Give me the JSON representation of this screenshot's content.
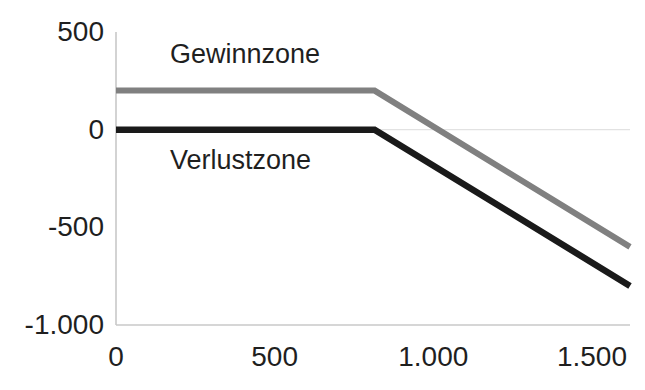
{
  "chart_data": {
    "type": "line",
    "title": "",
    "subtitle": "",
    "xlabel": "",
    "ylabel": "",
    "xlim": [
      0,
      1620
    ],
    "ylim": [
      -1000,
      500
    ],
    "xticks": [
      0,
      500,
      1000,
      1500
    ],
    "xticklabels": [
      "0",
      "500",
      "1.000",
      "1.500"
    ],
    "yticks": [
      500,
      0,
      -500,
      -1000
    ],
    "yticklabels": [
      "500",
      "0",
      "-500",
      "-1.000"
    ],
    "grid": false,
    "zero_line": true,
    "legend_position": "none",
    "annotations": [
      {
        "text": "Gewinnzone",
        "x": 170,
        "y": 380
      },
      {
        "text": "Verlustzone",
        "x": 170,
        "y": -160
      }
    ],
    "series": [
      {
        "name": "upper-line",
        "color": "#808080",
        "x": [
          0,
          815,
          1620
        ],
        "values": [
          200,
          200,
          -600
        ]
      },
      {
        "name": "lower-line",
        "color": "#1a1a1a",
        "x": [
          0,
          815,
          1620
        ],
        "values": [
          0,
          0,
          -800
        ]
      }
    ]
  },
  "axis": {
    "axis_color": "#c8c8c8",
    "zero_line_color": "#e2e2e2",
    "text_color": "#1f1f1f",
    "background": "#ffffff"
  }
}
